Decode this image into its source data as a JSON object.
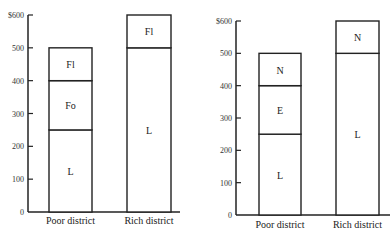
{
  "chart_data": [
    {
      "type": "bar",
      "stacked": true,
      "title": "",
      "xlabel": "",
      "ylabel": "",
      "ylim": [
        0,
        600
      ],
      "yticks": [
        "0",
        "100",
        "200",
        "300",
        "400",
        "500",
        "$600"
      ],
      "categories": [
        "Poor district",
        "Rich district"
      ],
      "series": [
        {
          "name": "L",
          "values": [
            250,
            500
          ]
        },
        {
          "name": "Fo",
          "values": [
            150,
            0
          ]
        },
        {
          "name": "Fl",
          "values": [
            100,
            100
          ]
        }
      ],
      "grid": false,
      "legend": "none (segment labels inside bars)"
    },
    {
      "type": "bar",
      "stacked": true,
      "title": "",
      "xlabel": "",
      "ylabel": "",
      "ylim": [
        0,
        600
      ],
      "yticks": [
        "0",
        "100",
        "200",
        "300",
        "400",
        "500",
        "$600"
      ],
      "categories": [
        "Poor district",
        "Rich district"
      ],
      "series": [
        {
          "name": "L",
          "values": [
            250,
            500
          ]
        },
        {
          "name": "E",
          "values": [
            150,
            0
          ]
        },
        {
          "name": "N",
          "values": [
            100,
            100
          ]
        }
      ],
      "grid": false,
      "legend": "none (segment labels inside bars)"
    }
  ]
}
